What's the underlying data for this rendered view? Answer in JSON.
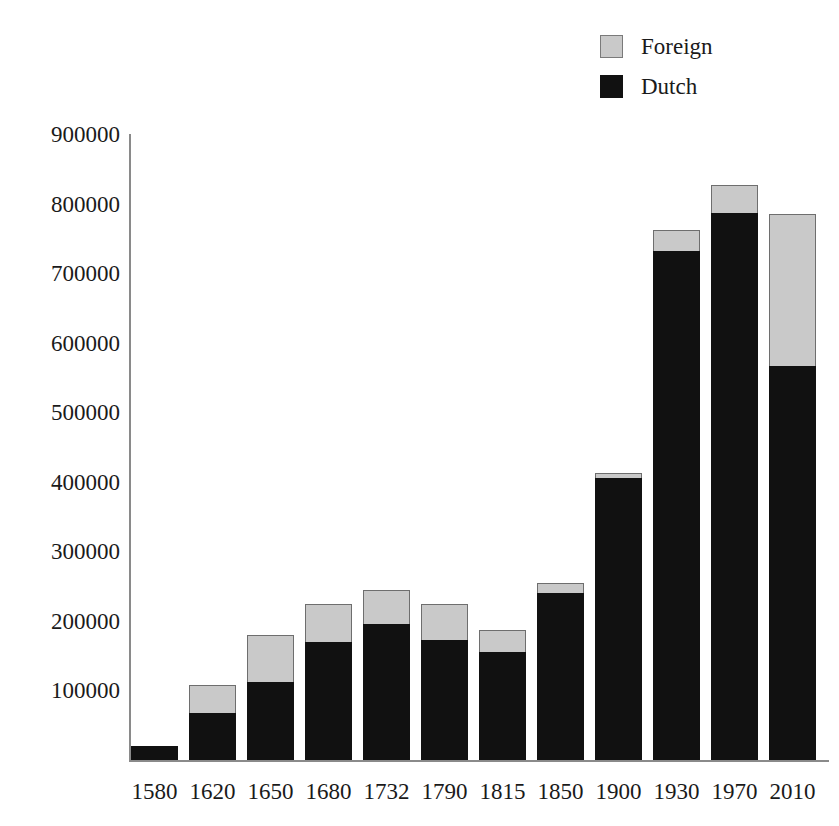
{
  "chart_data": {
    "type": "bar",
    "subtype": "stacked-vertical",
    "title": "",
    "subtitle": "",
    "xlabel": "",
    "ylabel": "",
    "grid": false,
    "legend_position": "top-right",
    "categories": [
      "1580",
      "1620",
      "1650",
      "1680",
      "1732",
      "1790",
      "1815",
      "1850",
      "1900",
      "1930",
      "1970",
      "2010"
    ],
    "series": [
      {
        "name": "Dutch",
        "color": "#111111",
        "values": [
          20000,
          68000,
          112000,
          170000,
          195000,
          172000,
          155000,
          240000,
          405000,
          732000,
          787000,
          567000
        ]
      },
      {
        "name": "Foreign",
        "color": "#c9c9c9",
        "values": [
          0,
          40000,
          68000,
          55000,
          50000,
          53000,
          32000,
          15000,
          8000,
          30000,
          40000,
          218000
        ]
      }
    ],
    "totals": [
      20000,
      108000,
      180000,
      225000,
      245000,
      225000,
      187000,
      255000,
      413000,
      762000,
      827000,
      785000
    ],
    "ylim": [
      0,
      900000
    ],
    "ytick_values": [
      100000,
      200000,
      300000,
      400000,
      500000,
      600000,
      700000,
      800000,
      900000
    ],
    "ytick_labels": [
      "100000",
      "200000",
      "300000",
      "400000",
      "500000",
      "600000",
      "700000",
      "800000",
      "900000"
    ]
  },
  "legend": {
    "entries": [
      {
        "label": "Foreign",
        "swatch": "foreign-swatch-icon",
        "color": "#c9c9c9"
      },
      {
        "label": "Dutch",
        "swatch": "dutch-swatch-icon",
        "color": "#111111"
      }
    ]
  },
  "axes": {
    "axis_color": "#8a8a8a",
    "background": "#ffffff"
  }
}
